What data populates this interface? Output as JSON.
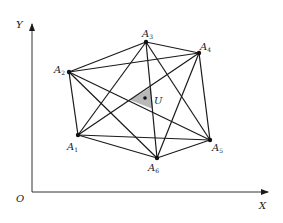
{
  "diagram": {
    "axes": {
      "origin_label": "O",
      "x_label": "X",
      "y_label": "Y"
    },
    "points": [
      {
        "id": "A1",
        "letter": "A",
        "sub": "1",
        "x": 78,
        "y": 135
      },
      {
        "id": "A2",
        "letter": "A",
        "sub": "2",
        "x": 69,
        "y": 72
      },
      {
        "id": "A3",
        "letter": "A",
        "sub": "3",
        "x": 146,
        "y": 42
      },
      {
        "id": "A4",
        "letter": "A",
        "sub": "4",
        "x": 199,
        "y": 53
      },
      {
        "id": "A5",
        "letter": "A",
        "sub": "5",
        "x": 210,
        "y": 140
      },
      {
        "id": "A6",
        "letter": "A",
        "sub": "6",
        "x": 157,
        "y": 158
      }
    ],
    "center": {
      "label": "U",
      "x": 145,
      "y": 98
    },
    "edges": "complete graph on A1..A6 (15 segments)",
    "shaded_region": "triangle around U",
    "colors": {
      "line": "#1a1a1a",
      "shade": "#b8b8b8",
      "background": "#ffffff"
    }
  }
}
